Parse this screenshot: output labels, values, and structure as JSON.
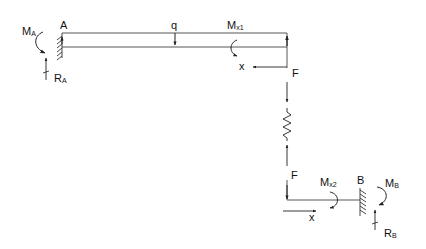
{
  "diagram": {
    "type": "free-body diagram of beam-spring-beam system",
    "colors": {
      "line": "#222222",
      "background": "#ffffff"
    },
    "labels": {
      "point_a": "A",
      "point_b": "B",
      "load_q": "q",
      "moment_a": "M",
      "moment_a_sub": "A",
      "reaction_a": "R",
      "reaction_a_sub": "A",
      "moment_x1": "M",
      "moment_x1_sub": "x1",
      "coord_x1": "x",
      "force_f_top": "F",
      "force_f_bottom": "F",
      "moment_x2": "M",
      "moment_x2_sub": "x2",
      "coord_x2": "x",
      "moment_b": "M",
      "moment_b_sub": "B",
      "reaction_b": "R",
      "reaction_b_sub": "B"
    },
    "elements": [
      "fixed-support-A",
      "beam-top",
      "distributed-load-q",
      "cut-moment-Mx1",
      "x-axis-top",
      "force-F-down",
      "spring",
      "force-F-up",
      "beam-bottom",
      "cut-moment-Mx2",
      "x-axis-bottom",
      "fixed-support-B",
      "moment-MA",
      "reaction-RA",
      "moment-MB",
      "reaction-RB"
    ]
  }
}
